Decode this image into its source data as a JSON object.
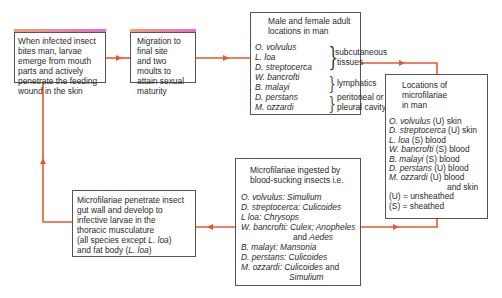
{
  "diagram": {
    "colors": {
      "arrow": "#e8572a",
      "border": "#555555",
      "top_strip_start": "#f0a36a",
      "top_strip_end": "#e56bd0"
    },
    "box1": {
      "lines": [
        "When infected insect",
        "bites man, larvae",
        "emerge from mouth",
        "parts and actively",
        "penetrate the feeding",
        "wound in the skin"
      ]
    },
    "box2": {
      "lines": [
        "Migration to",
        "final site",
        "and two",
        "moults to",
        "attain sexual",
        "maturity"
      ]
    },
    "box3": {
      "title_lines": [
        "Male and female adult",
        "locations in man"
      ],
      "groups": [
        {
          "species": [
            "O. volvulus",
            "L. loa",
            "D. streptocerca"
          ],
          "location_lines": [
            "subcutaneous",
            "tissues"
          ]
        },
        {
          "species": [
            "W. bancrofti",
            "B. malayi"
          ],
          "location_lines": [
            "lymphatics"
          ]
        },
        {
          "species": [
            "D. perstans",
            "M. ozzardi"
          ],
          "location_lines": [
            "peritoneal or",
            "pleural cavity"
          ]
        }
      ]
    },
    "box4": {
      "title_lines": [
        "Locations of",
        "microfilariae",
        "in man"
      ],
      "entries": [
        {
          "species": "O. volvulus",
          "rest": " (U) skin"
        },
        {
          "species": "D. streptocerca",
          "rest": " (U) skin"
        },
        {
          "species": "L. loa",
          "rest": " (S) blood"
        },
        {
          "species": "W. bancrofti",
          "rest": " (S) blood"
        },
        {
          "species": "B. malayi",
          "rest": " (S) blood"
        },
        {
          "species": "D. perstans",
          "rest": " (U) blood"
        },
        {
          "species": "M. ozzardi",
          "rest": " (U) blood"
        }
      ],
      "continuation": "and skin",
      "legend": [
        "(U)  =  unsheathed",
        "(S)  =  sheathed"
      ]
    },
    "box5": {
      "title_lines": [
        "Microfilariae ingested by",
        "blood-sucking insects i.e."
      ],
      "entries": [
        {
          "species": "O. volvulus:",
          "vector": " Simulium"
        },
        {
          "species": "D. streptocerca:",
          "vector": " Culicoides"
        },
        {
          "species": "L loa:",
          "vector": " Chrysops"
        },
        {
          "species": "W. bancrofti:",
          "vector": " Culex; Anopheles"
        },
        {
          "species": "B. malayi:",
          "vector": " Mansonia"
        },
        {
          "species": "D. perstans:",
          "vector": " Culicoides"
        },
        {
          "species": "M. ozzardi:",
          "vector": " Culicoides"
        }
      ],
      "wban_cont_plain": "and ",
      "wban_cont_it": "Aedes",
      "mozz_and": " and",
      "mozz_cont": "Simulium"
    },
    "box6": {
      "lines": [
        "Microfilariae penetrate insect",
        "gut wall and develop to",
        "infective larvae in  the",
        "thoracic musculature"
      ],
      "line5_a": "(all species except ",
      "line5_it": "L. loa",
      "line5_b": ")",
      "line6_a": "and fat body (",
      "line6_it": "L. loa",
      "line6_b": ")"
    }
  }
}
